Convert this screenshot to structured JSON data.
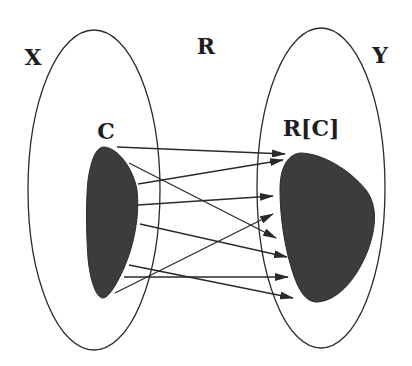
{
  "labels": {
    "domain_set": "X",
    "relation": "R",
    "codomain_set": "Y",
    "subset": "C",
    "image": "R[C]"
  },
  "colors": {
    "background": "#ffffff",
    "stroke": "#2a2a2a",
    "fill": "#3c3c3c",
    "text": "#1e1e1e"
  },
  "shapes": {
    "set_X": {
      "cx": 94,
      "cy": 190,
      "rx": 66,
      "ry": 160
    },
    "set_Y": {
      "cx": 321,
      "cy": 188,
      "rx": 64,
      "ry": 160
    },
    "subset_C": "filled blob inside X",
    "image_RC": "filled blob inside Y"
  },
  "label_positions": {
    "X": [
      33,
      57
    ],
    "R": [
      206,
      46
    ],
    "Y": [
      380,
      55
    ],
    "C": [
      106,
      131
    ],
    "RC": [
      311,
      128
    ]
  },
  "arrows": [
    {
      "from": [
        117,
        147
      ],
      "to": [
        285,
        154
      ]
    },
    {
      "from": [
        129,
        163
      ],
      "to": [
        276,
        238
      ]
    },
    {
      "from": [
        138,
        184
      ],
      "to": [
        283,
        160
      ]
    },
    {
      "from": [
        138,
        205
      ],
      "to": [
        273,
        196
      ]
    },
    {
      "from": [
        140,
        224
      ],
      "to": [
        287,
        257
      ]
    },
    {
      "from": [
        129,
        265
      ],
      "to": [
        293,
        298
      ]
    },
    {
      "from": [
        124,
        277
      ],
      "to": [
        288,
        277
      ]
    },
    {
      "from": [
        115,
        293
      ],
      "to": [
        273,
        214
      ]
    }
  ]
}
